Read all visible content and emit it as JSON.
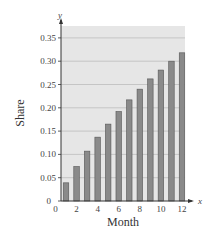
{
  "chart_data": {
    "type": "bar",
    "title": "",
    "xlabel": "Month",
    "ylabel": "Share",
    "x_axis_var": "x",
    "y_axis_var": "y",
    "categories": [
      1,
      2,
      3,
      4,
      5,
      6,
      7,
      8,
      9,
      10,
      11,
      12
    ],
    "values": [
      0.039,
      0.074,
      0.107,
      0.137,
      0.165,
      0.192,
      0.217,
      0.24,
      0.262,
      0.281,
      0.3,
      0.318
    ],
    "xticks": [
      "0",
      "2",
      "4",
      "6",
      "8",
      "10",
      "12"
    ],
    "yticks": [
      "0",
      "0.05",
      "0.10",
      "0.15",
      "0.20",
      "0.25",
      "0.30",
      "0.35"
    ],
    "xlim": [
      0,
      12.5
    ],
    "ylim": [
      0,
      0.375
    ],
    "grid": true,
    "legend": null,
    "colors": {
      "plot_background": "#e6e6e6",
      "bar_fill": "#8a8a8a",
      "bar_edge": "#555555",
      "grid": "#bdbdbd",
      "axis": "#333333"
    }
  }
}
